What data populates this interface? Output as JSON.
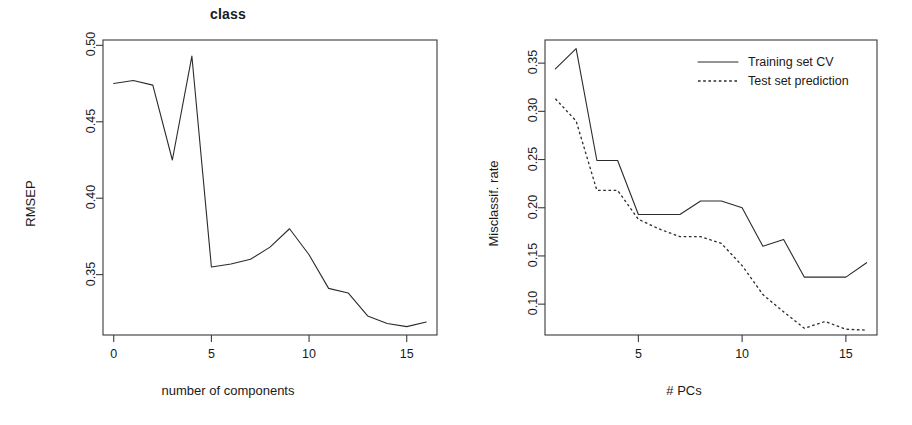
{
  "figure": {
    "background_color": "#ffffff",
    "line_color": "#2b2b2b",
    "axis_color": "#3a3a3a"
  },
  "panels": [
    {
      "id": "class-rmsep",
      "title": "class",
      "xlabel": "number of components",
      "ylabel": "RMSEP",
      "x_ticks": [
        "0",
        "5",
        "10",
        "15"
      ],
      "y_ticks": [
        "0.50",
        "0.45",
        "0.40",
        "0.35"
      ]
    },
    {
      "id": "misclassification-rate",
      "title": "",
      "xlabel": "# PCs",
      "ylabel": "Misclassif. rate",
      "x_ticks": [
        "5",
        "10",
        "15"
      ],
      "y_ticks": [
        "0.35",
        "0.30",
        "0.25",
        "0.20",
        "0.15",
        "0.10"
      ],
      "legend": [
        {
          "label": "Training set CV",
          "style": "solid"
        },
        {
          "label": "Test set prediction",
          "style": "dashed"
        }
      ]
    }
  ],
  "chart_data": [
    {
      "type": "line",
      "title": "class",
      "xlabel": "number of components",
      "ylabel": "RMSEP",
      "x": [
        0,
        1,
        2,
        3,
        4,
        5,
        6,
        7,
        8,
        9,
        10,
        11,
        12,
        13,
        14,
        15,
        16
      ],
      "values": [
        0.475,
        0.477,
        0.474,
        0.425,
        0.493,
        0.355,
        0.357,
        0.36,
        0.368,
        0.38,
        0.363,
        0.341,
        0.338,
        0.323,
        0.318,
        0.316,
        0.319
      ],
      "xlim": [
        -0.55,
        16.55
      ],
      "ylim": [
        0.3105,
        0.5035
      ],
      "xticks": [
        0,
        5,
        10,
        15
      ],
      "yticks": [
        0.5,
        0.45,
        0.4,
        0.35
      ],
      "grid": false,
      "legend": "none",
      "line_style": "solid"
    },
    {
      "type": "line",
      "title": "",
      "xlabel": "# PCs",
      "ylabel": "Misclassif. rate",
      "x": [
        1,
        2,
        3,
        4,
        5,
        6,
        7,
        8,
        9,
        10,
        11,
        12,
        13,
        14,
        15,
        16
      ],
      "series": [
        {
          "name": "Training set CV",
          "style": "solid",
          "values": [
            0.344,
            0.365,
            0.249,
            0.249,
            0.193,
            0.193,
            0.193,
            0.207,
            0.207,
            0.2,
            0.16,
            0.167,
            0.128,
            0.128,
            0.128,
            0.143
          ]
        },
        {
          "name": "Test set prediction",
          "style": "dashed",
          "values": [
            0.313,
            0.29,
            0.218,
            0.218,
            0.188,
            0.178,
            0.17,
            0.17,
            0.163,
            0.14,
            0.11,
            0.092,
            0.075,
            0.082,
            0.074,
            0.073
          ]
        }
      ],
      "xlim": [
        0.5,
        16.5
      ],
      "ylim": [
        0.068,
        0.374
      ],
      "xticks": [
        5,
        10,
        15
      ],
      "yticks": [
        0.35,
        0.3,
        0.25,
        0.2,
        0.15,
        0.1
      ],
      "grid": false,
      "legend": "top-right"
    }
  ]
}
